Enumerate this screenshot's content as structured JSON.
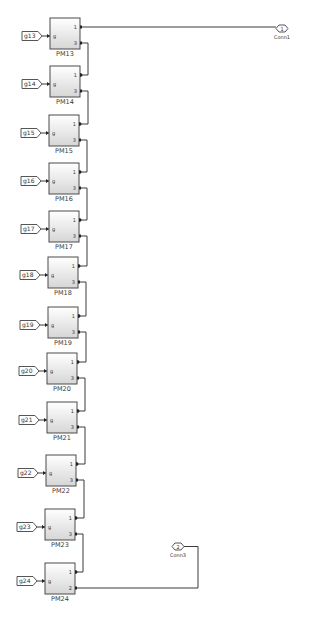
{
  "diagram": {
    "background": "#ffffff",
    "block_fill_top": "#ffffff",
    "block_fill_bottom": "#d9d9d9",
    "blocks": [
      {
        "name": "PM13",
        "input_tag": "g13",
        "in_port": "g",
        "out_ports": [
          "1",
          "3"
        ],
        "x": 50,
        "y": 18
      },
      {
        "name": "PM14",
        "input_tag": "g14",
        "in_port": "g",
        "out_ports": [
          "1",
          "3"
        ],
        "x": 50,
        "y": 66
      },
      {
        "name": "PM15",
        "input_tag": "g15",
        "in_port": "g",
        "out_ports": [
          "1",
          "3"
        ],
        "x": 49,
        "y": 115
      },
      {
        "name": "PM16",
        "input_tag": "g16",
        "in_port": "g",
        "out_ports": [
          "1",
          "3"
        ],
        "x": 49,
        "y": 163
      },
      {
        "name": "PM17",
        "input_tag": "g17",
        "in_port": "g",
        "out_ports": [
          "1",
          "3"
        ],
        "x": 49,
        "y": 211
      },
      {
        "name": "PM18",
        "input_tag": "g18",
        "in_port": "g",
        "out_ports": [
          "1",
          "3"
        ],
        "x": 48,
        "y": 257
      },
      {
        "name": "PM19",
        "input_tag": "g19",
        "in_port": "g",
        "out_ports": [
          "1",
          "3"
        ],
        "x": 48,
        "y": 307
      },
      {
        "name": "PM20",
        "input_tag": "g20",
        "in_port": "g",
        "out_ports": [
          "1",
          "3"
        ],
        "x": 47,
        "y": 353
      },
      {
        "name": "PM21",
        "input_tag": "g21",
        "in_port": "g",
        "out_ports": [
          "1",
          "3"
        ],
        "x": 47,
        "y": 402
      },
      {
        "name": "PM22",
        "input_tag": "g22",
        "in_port": "g",
        "out_ports": [
          "1",
          "3"
        ],
        "x": 46,
        "y": 455
      },
      {
        "name": "PM23",
        "input_tag": "g23",
        "in_port": "g",
        "out_ports": [
          "1",
          "3"
        ],
        "x": 45,
        "y": 509
      },
      {
        "name": "PM24",
        "input_tag": "g24",
        "in_port": "g",
        "out_ports": [
          "1",
          "2"
        ],
        "x": 45,
        "y": 563
      }
    ],
    "connection_ports": [
      {
        "number": "1",
        "label": "Conn1",
        "x": 276,
        "y": 25
      },
      {
        "number": "2",
        "label": "Conn3",
        "x": 172,
        "y": 543
      }
    ]
  }
}
